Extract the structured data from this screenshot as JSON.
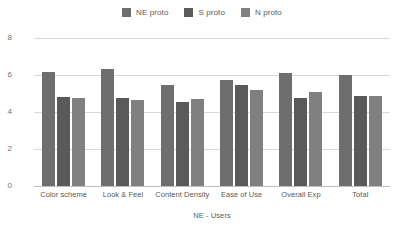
{
  "chart_data": {
    "type": "bar",
    "title": "",
    "xlabel": "NE - Users",
    "ylabel": "",
    "categories": [
      "Color scheme",
      "Look & Feel",
      "Content Density",
      "Ease of Use",
      "Overall Exp",
      "Total"
    ],
    "series": [
      {
        "name": "NE proto",
        "color": "#6e6e6e",
        "values": [
          6.15,
          6.35,
          5.45,
          5.75,
          6.1,
          6.0
        ]
      },
      {
        "name": "S proto",
        "color": "#5a5a5a",
        "values": [
          4.8,
          4.75,
          4.55,
          5.45,
          4.75,
          4.85
        ]
      },
      {
        "name": "N proto",
        "color": "#808080",
        "values": [
          4.75,
          4.65,
          4.7,
          5.2,
          5.1,
          4.85
        ]
      }
    ],
    "ylim": [
      0,
      8
    ],
    "yticks": [
      0,
      2,
      4,
      6,
      8
    ],
    "ytick_labels": [
      "0",
      "2",
      "4",
      "6",
      "8"
    ],
    "grid": true,
    "legend_position": "top-center",
    "gridline_color": "#d9d9d9",
    "axis_color": "#bfbfbf",
    "background_color": "#ffffff",
    "text_color": "#595959"
  }
}
